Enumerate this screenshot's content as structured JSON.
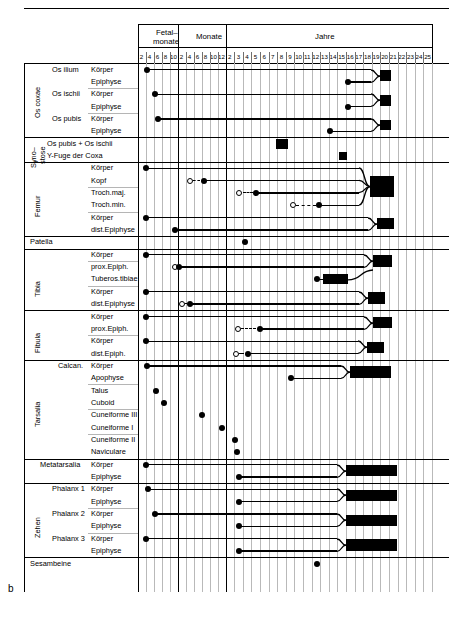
{
  "figure": {
    "label": "b"
  },
  "header": {
    "groups": [
      {
        "name": "fetal-months",
        "label": "Fetal-\nmonate",
        "label_line1": "Fetal–",
        "label_line2": "monate",
        "ticks": [
          "2",
          "4",
          "6",
          "8",
          "10"
        ]
      },
      {
        "name": "months",
        "label": "Monate",
        "ticks": [
          "2",
          "4",
          "6",
          "8",
          "10",
          "12"
        ]
      },
      {
        "name": "years",
        "label": "Jahre",
        "ticks": [
          "2",
          "3",
          "4",
          "5",
          "6",
          "7",
          "8",
          "9",
          "10",
          "11",
          "12",
          "13",
          "14",
          "15",
          "16",
          "17",
          "18",
          "19",
          "20",
          "21",
          "22",
          "23",
          "24",
          "25"
        ]
      }
    ]
  },
  "sections": [
    {
      "name": "os-coxae",
      "group_label": "Os coxae",
      "rows": [
        {
          "bone": "Os ilium",
          "part": "Körper"
        },
        {
          "bone": "",
          "part": "Epiphyse"
        },
        {
          "bone": "Os ischii",
          "part": "Körper"
        },
        {
          "bone": "",
          "part": "Epiphyse"
        },
        {
          "bone": "Os pubis",
          "part": "Körper"
        },
        {
          "bone": "",
          "part": "Epiphyse"
        }
      ]
    },
    {
      "name": "synostose",
      "group_label": "Syno-\nstose",
      "group_label_line1": "Syno–",
      "group_label_line2": "stose",
      "rows": [
        {
          "bone": "Os pubis + Os ischii",
          "part": ""
        },
        {
          "bone": "Y-Fuge der Coxa",
          "part": ""
        }
      ]
    },
    {
      "name": "femur",
      "group_label": "Femur",
      "rows": [
        {
          "bone": "",
          "part": "Körper"
        },
        {
          "bone": "",
          "part": "Kopf"
        },
        {
          "bone": "",
          "part": "Troch.maj."
        },
        {
          "bone": "",
          "part": "Troch.min."
        },
        {
          "bone": "",
          "part": "Körper"
        },
        {
          "bone": "",
          "part": "dist.Epiphyse"
        }
      ]
    },
    {
      "name": "patella",
      "group_label": "",
      "rows": [
        {
          "bone": "Patella",
          "part": ""
        }
      ]
    },
    {
      "name": "tibia",
      "group_label": "Tibia",
      "rows": [
        {
          "bone": "",
          "part": "Körper"
        },
        {
          "bone": "",
          "part": "prox.Epiph."
        },
        {
          "bone": "",
          "part": "Tuberos.tibiae"
        },
        {
          "bone": "",
          "part": "Körper"
        },
        {
          "bone": "",
          "part": "dist.Epiphyse"
        }
      ]
    },
    {
      "name": "fibula",
      "group_label": "Fibula",
      "rows": [
        {
          "bone": "",
          "part": "Körper"
        },
        {
          "bone": "",
          "part": "prox.Epiph."
        },
        {
          "bone": "",
          "part": "Körper"
        },
        {
          "bone": "",
          "part": "dist.Epiph."
        }
      ]
    },
    {
      "name": "tarsalia",
      "group_label": "Tarsalia",
      "rows": [
        {
          "bone": "Calcan.",
          "part": "Körper"
        },
        {
          "bone": "",
          "part": "Apophyse"
        },
        {
          "bone": "",
          "part": "Talus"
        },
        {
          "bone": "",
          "part": "Cuboid"
        },
        {
          "bone": "",
          "part": "Cuneiforme III"
        },
        {
          "bone": "",
          "part": "Cuneiforme I"
        },
        {
          "bone": "",
          "part": "Cuneiforme II"
        },
        {
          "bone": "",
          "part": "Naviculare"
        }
      ]
    },
    {
      "name": "metatarsalia",
      "group_label": "",
      "rows": [
        {
          "bone": "Metatarsalia",
          "part": "Körper"
        },
        {
          "bone": "",
          "part": "Epiphyse"
        }
      ]
    },
    {
      "name": "zehen",
      "group_label": "Zehen",
      "rows": [
        {
          "bone": "Phalanx 1",
          "part": "Körper"
        },
        {
          "bone": "",
          "part": "Epiphyse"
        },
        {
          "bone": "Phalanx 2",
          "part": "Körper"
        },
        {
          "bone": "",
          "part": "Epiphyse"
        },
        {
          "bone": "Phalanx 3",
          "part": "Körper"
        },
        {
          "bone": "",
          "part": "Epiphyse"
        }
      ]
    },
    {
      "name": "sesambeine",
      "group_label": "",
      "rows": [
        {
          "bone": "Sesambeine",
          "part": ""
        }
      ]
    }
  ],
  "chart_data": {
    "type": "timeline",
    "xlabel": "",
    "ylabel": "",
    "axis_segments": [
      {
        "name": "Fetalmonate",
        "unit": "fetal months",
        "ticks": [
          2,
          4,
          6,
          8,
          10
        ]
      },
      {
        "name": "Monate",
        "unit": "months",
        "ticks": [
          2,
          4,
          6,
          8,
          10,
          12
        ]
      },
      {
        "name": "Jahre",
        "unit": "years",
        "ticks": [
          2,
          3,
          4,
          5,
          6,
          7,
          8,
          9,
          10,
          11,
          12,
          13,
          14,
          15,
          16,
          17,
          18,
          19,
          20,
          21,
          22,
          23,
          24,
          25
        ]
      }
    ],
    "marker_legend": {
      "filled_dot": "Ossifikationsbeginn",
      "open_dot": "frühester Ossifikationsbeginn (variabel)",
      "dashed_line": "variabler Zeitraum",
      "solid_line": "Wachstumsphase",
      "black_block": "Synostose / Epiphysenfugenschluss"
    },
    "tracks": [
      {
        "label": "Os ilium Körper",
        "onset": {
          "unit": "fetal",
          "value": 2.4,
          "type": "filled"
        },
        "line_end_unit": "year",
        "line_end": 19.0,
        "fusion": {
          "unit": "year",
          "start": 19.0,
          "end": 20.2
        }
      },
      {
        "label": "Os ilium Epiphyse",
        "onset": {
          "unit": "year",
          "value": 15.3,
          "type": "filled"
        },
        "line_end_unit": "year",
        "line_end": 19.0,
        "fusion_shared": true
      },
      {
        "label": "Os ischii Körper",
        "onset": {
          "unit": "fetal",
          "value": 4.3,
          "type": "filled"
        },
        "line_end_unit": "year",
        "line_end": 19.0,
        "fusion": {
          "unit": "year",
          "start": 19.0,
          "end": 20.2
        }
      },
      {
        "label": "Os ischii Epiphyse",
        "onset": {
          "unit": "year",
          "value": 15.3,
          "type": "filled"
        },
        "line_end_unit": "year",
        "line_end": 19.0,
        "fusion_shared": true
      },
      {
        "label": "Os pubis Körper",
        "onset": {
          "unit": "fetal",
          "value": 5.2,
          "type": "filled"
        },
        "line_end_unit": "year",
        "line_end": 19.0,
        "fusion": {
          "unit": "year",
          "start": 19.0,
          "end": 20.2
        }
      },
      {
        "label": "Os pubis Epiphyse",
        "onset": {
          "unit": "year",
          "value": 13.2,
          "type": "filled"
        },
        "line_end_unit": "year",
        "line_end": 19.0,
        "fusion_shared": true
      },
      {
        "label": "Os pubis + Os ischii",
        "onset": null,
        "fusion": {
          "unit": "year",
          "start": 6.9,
          "end": 8.3
        }
      },
      {
        "label": "Y-Fuge der Coxa",
        "onset": null,
        "fusion": {
          "unit": "year",
          "start": 14.2,
          "end": 15.1
        }
      },
      {
        "label": "Femur Körper",
        "onset": {
          "unit": "fetal",
          "value": 2.2,
          "type": "filled"
        },
        "line_end_unit": "year",
        "line_end": 17.8,
        "fusion": {
          "unit": "year",
          "start": 17.8,
          "end": 20.6
        }
      },
      {
        "label": "Femur Kopf",
        "onset": {
          "unit": "month",
          "value": 3.0,
          "type": "open"
        },
        "onset_confirmed": {
          "unit": "month",
          "value": 6.5,
          "type": "filled"
        },
        "line_end_unit": "year",
        "line_end": 17.8,
        "fusion_shared": true
      },
      {
        "label": "Femur Troch.maj.",
        "onset": {
          "unit": "year",
          "value": 2.6,
          "type": "open"
        },
        "onset_confirmed": {
          "unit": "year",
          "value": 4.6,
          "type": "filled"
        },
        "line_end_unit": "year",
        "line_end": 17.8,
        "fusion_shared": true
      },
      {
        "label": "Femur Troch.min.",
        "onset": {
          "unit": "year",
          "value": 8.8,
          "type": "open"
        },
        "onset_confirmed": {
          "unit": "year",
          "value": 11.9,
          "type": "filled"
        },
        "line_end_unit": "year",
        "line_end": 17.8,
        "fusion_shared": true
      },
      {
        "label": "Femur Körper (distal)",
        "onset": {
          "unit": "fetal",
          "value": 2.2,
          "type": "filled"
        },
        "line_end_unit": "year",
        "line_end": 18.6,
        "fusion": {
          "unit": "year",
          "start": 18.6,
          "end": 20.6
        }
      },
      {
        "label": "Femur dist.Epiphyse",
        "onset": {
          "unit": "fetal",
          "value": 9.3,
          "type": "filled"
        },
        "line_end_unit": "year",
        "line_end": 18.6,
        "fusion_shared": true
      },
      {
        "label": "Patella",
        "onset": {
          "unit": "year",
          "value": 3.3,
          "type": "filled"
        },
        "line_end": null,
        "fusion": null
      },
      {
        "label": "Tibia Körper",
        "onset": {
          "unit": "fetal",
          "value": 2.2,
          "type": "filled"
        },
        "line_end_unit": "year",
        "line_end": 18.2,
        "fusion": {
          "unit": "year",
          "start": 18.2,
          "end": 20.4
        }
      },
      {
        "label": "Tibia prox.Epiph.",
        "onset": {
          "unit": "fetal",
          "value": 9.4,
          "type": "open"
        },
        "onset_confirmed": {
          "unit": "fetal",
          "value": 10.4,
          "type": "filled"
        },
        "line_end_unit": "year",
        "line_end": 18.2,
        "fusion_shared": true
      },
      {
        "label": "Tibia Tuberos.tibiae",
        "onset": {
          "unit": "year",
          "value": 11.6,
          "type": "filled"
        },
        "fusion": {
          "unit": "year",
          "start": 12.3,
          "end": 15.2
        }
      },
      {
        "label": "Tibia Körper (distal)",
        "onset": {
          "unit": "fetal",
          "value": 2.2,
          "type": "filled"
        },
        "line_end_unit": "year",
        "line_end": 17.6,
        "fusion": {
          "unit": "year",
          "start": 17.6,
          "end": 19.6
        }
      },
      {
        "label": "Tibia dist.Epiphyse",
        "onset": {
          "unit": "month",
          "value": 1.0,
          "type": "open"
        },
        "onset_confirmed": {
          "unit": "month",
          "value": 3.2,
          "type": "filled"
        },
        "line_end_unit": "year",
        "line_end": 17.6,
        "fusion_shared": true
      },
      {
        "label": "Fibula Körper",
        "onset": {
          "unit": "fetal",
          "value": 2.2,
          "type": "filled"
        },
        "line_end_unit": "year",
        "line_end": 18.2,
        "fusion": {
          "unit": "year",
          "start": 18.2,
          "end": 20.4
        }
      },
      {
        "label": "Fibula prox.Epiph.",
        "onset": {
          "unit": "year",
          "value": 2.4,
          "type": "open"
        },
        "onset_confirmed": {
          "unit": "year",
          "value": 5.0,
          "type": "filled"
        },
        "line_end_unit": "year",
        "line_end": 18.2,
        "fusion_shared": true
      },
      {
        "label": "Fibula Körper (distal)",
        "onset": {
          "unit": "fetal",
          "value": 2.2,
          "type": "filled"
        },
        "line_end_unit": "year",
        "line_end": 17.4,
        "fusion": {
          "unit": "year",
          "start": 17.4,
          "end": 19.4
        }
      },
      {
        "label": "Fibula dist.Epiph.",
        "onset": {
          "unit": "year",
          "value": 2.2,
          "type": "open"
        },
        "onset_confirmed": {
          "unit": "year",
          "value": 3.6,
          "type": "filled"
        },
        "line_end_unit": "year",
        "line_end": 17.4,
        "fusion_shared": true
      },
      {
        "label": "Calcaneus Körper",
        "onset": {
          "unit": "fetal",
          "value": 2.3,
          "type": "filled"
        },
        "line_end_unit": "year",
        "line_end": 15.5,
        "fusion": {
          "unit": "year",
          "start": 15.5,
          "end": 20.2
        }
      },
      {
        "label": "Calcaneus Apophyse",
        "onset": {
          "unit": "year",
          "value": 8.6,
          "type": "filled"
        },
        "line_end_unit": "year",
        "line_end": 15.5,
        "fusion_shared": true
      },
      {
        "label": "Talus",
        "onset": {
          "unit": "fetal",
          "value": 4.5,
          "type": "filled"
        },
        "line_end": null,
        "fusion": null
      },
      {
        "label": "Cuboid",
        "onset": {
          "unit": "fetal",
          "value": 6.6,
          "type": "filled"
        },
        "line_end": null,
        "fusion": null
      },
      {
        "label": "Cuneiforme III",
        "onset": {
          "unit": "month",
          "value": 6.2,
          "type": "filled"
        },
        "line_end": null,
        "fusion": null
      },
      {
        "label": "Cuneiforme I",
        "onset": {
          "unit": "month",
          "value": 11.0,
          "type": "filled"
        },
        "line_end": null,
        "fusion": null
      },
      {
        "label": "Cuneiforme II",
        "onset": {
          "unit": "year",
          "value": 2.1,
          "type": "filled"
        },
        "line_end": null,
        "fusion": null
      },
      {
        "label": "Naviculare",
        "onset": {
          "unit": "year",
          "value": 2.3,
          "type": "filled"
        },
        "line_end": null,
        "fusion": null
      },
      {
        "label": "Metatarsalia Körper",
        "onset": {
          "unit": "fetal",
          "value": 2.2,
          "type": "filled"
        },
        "line_end_unit": "year",
        "line_end": 15.0,
        "fusion": {
          "unit": "year",
          "start": 15.0,
          "end": 21.0
        }
      },
      {
        "label": "Metatarsalia Epiphyse",
        "onset": {
          "unit": "year",
          "value": 2.6,
          "type": "filled"
        },
        "line_end_unit": "year",
        "line_end": 15.0,
        "fusion_shared": true
      },
      {
        "label": "Phalanx 1 Körper",
        "onset": {
          "unit": "fetal",
          "value": 2.7,
          "type": "filled"
        },
        "line_end_unit": "year",
        "line_end": 15.0,
        "fusion": {
          "unit": "year",
          "start": 15.0,
          "end": 21.0
        }
      },
      {
        "label": "Phalanx 1 Epiphyse",
        "onset": {
          "unit": "year",
          "value": 2.6,
          "type": "filled"
        },
        "line_end_unit": "year",
        "line_end": 15.0,
        "fusion_shared": true
      },
      {
        "label": "Phalanx 2 Körper",
        "onset": {
          "unit": "fetal",
          "value": 4.3,
          "type": "filled"
        },
        "line_end_unit": "year",
        "line_end": 15.0,
        "fusion": {
          "unit": "year",
          "start": 15.0,
          "end": 21.0
        }
      },
      {
        "label": "Phalanx 2 Epiphyse",
        "onset": {
          "unit": "year",
          "value": 2.6,
          "type": "filled"
        },
        "line_end_unit": "year",
        "line_end": 15.0,
        "fusion_shared": true
      },
      {
        "label": "Phalanx 3 Körper",
        "onset": {
          "unit": "fetal",
          "value": 2.2,
          "type": "filled"
        },
        "line_end_unit": "year",
        "line_end": 15.0,
        "fusion": {
          "unit": "year",
          "start": 15.0,
          "end": 21.0
        }
      },
      {
        "label": "Phalanx 3 Epiphyse",
        "onset": {
          "unit": "year",
          "value": 2.6,
          "type": "filled"
        },
        "line_end_unit": "year",
        "line_end": 15.0,
        "fusion_shared": true
      },
      {
        "label": "Sesambeine",
        "onset": {
          "unit": "year",
          "value": 11.6,
          "type": "filled"
        },
        "line_end": null,
        "fusion": null
      }
    ]
  }
}
